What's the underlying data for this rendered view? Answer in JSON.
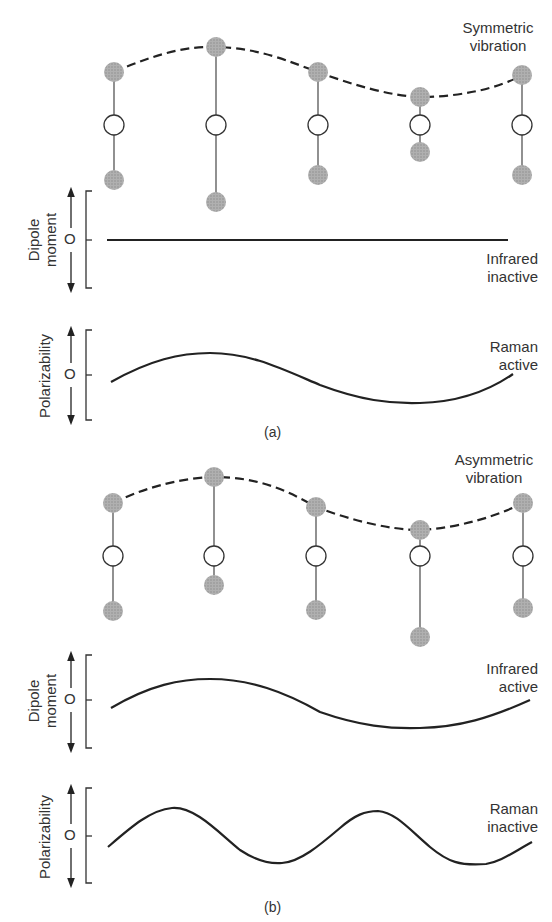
{
  "panels": [
    {
      "id": "a",
      "caption": "(a)",
      "vibration_label": [
        "Symmetric",
        "vibration"
      ],
      "dipole": {
        "axis_label": [
          "Dipole",
          "moment"
        ],
        "zero": "O",
        "activity": [
          "Infrared",
          "inactive"
        ]
      },
      "polarizability": {
        "axis_label": "Polarizability",
        "zero": "O",
        "activity": [
          "Raman",
          "active"
        ]
      }
    },
    {
      "id": "b",
      "caption": "(b)",
      "vibration_label": [
        "Asymmetric",
        "vibration"
      ],
      "dipole": {
        "axis_label": [
          "Dipole",
          "moment"
        ],
        "zero": "O",
        "activity": [
          "Infrared",
          "active"
        ]
      },
      "polarizability": {
        "axis_label": "Polarizability",
        "zero": "O",
        "activity": [
          "Raman",
          "inactive"
        ]
      }
    }
  ],
  "colors": {
    "atom_fill": "#a8a8a8",
    "center_fill": "#ffffff",
    "line": "#222222"
  }
}
